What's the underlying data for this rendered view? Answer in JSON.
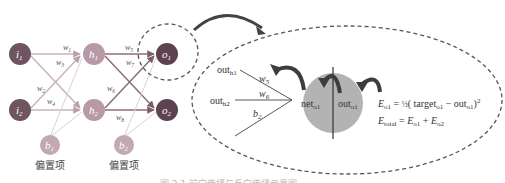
{
  "network": {
    "input_nodes": [
      {
        "id": "i1",
        "label": "i",
        "sub": "1"
      },
      {
        "id": "i2",
        "label": "i",
        "sub": "2"
      }
    ],
    "hidden_nodes": [
      {
        "id": "h1",
        "label": "h",
        "sub": "1"
      },
      {
        "id": "h2",
        "label": "h",
        "sub": "2"
      }
    ],
    "output_nodes": [
      {
        "id": "o1",
        "label": "o",
        "sub": "1"
      },
      {
        "id": "o2",
        "label": "o",
        "sub": "2"
      }
    ],
    "bias_nodes": [
      {
        "id": "b1",
        "label": "b",
        "sub": "1",
        "caption": "偏置项"
      },
      {
        "id": "b2",
        "label": "b",
        "sub": "2",
        "caption": "偏置项"
      }
    ],
    "weights": [
      {
        "label": "w",
        "sub": "1"
      },
      {
        "label": "w",
        "sub": "3"
      },
      {
        "label": "w",
        "sub": "2"
      },
      {
        "label": "w",
        "sub": "4"
      },
      {
        "label": "w",
        "sub": "5"
      },
      {
        "label": "w",
        "sub": "7"
      },
      {
        "label": "w",
        "sub": "6"
      },
      {
        "label": "w",
        "sub": "8"
      }
    ],
    "colors": {
      "input": "#6e5560",
      "hidden": "#b79aa6",
      "output": "#5e4250",
      "bias": "#c2a8b3",
      "edge": "#c9b4bc",
      "bias_edge": "#ddd0d5"
    }
  },
  "zoom": {
    "inputs": [
      {
        "label": "out",
        "sub": "h1"
      },
      {
        "label": "out",
        "sub": "h2"
      }
    ],
    "weights": [
      {
        "label": "w",
        "sub": "5"
      },
      {
        "label": "w",
        "sub": "6"
      },
      {
        "label": "b",
        "sub": "2"
      }
    ],
    "neuron": {
      "left": {
        "label": "net",
        "sub": "o1"
      },
      "right": {
        "label": "out",
        "sub": "o1"
      },
      "fill": "#b3b3b3"
    },
    "formula1": {
      "lhs": "E",
      "lhs_sub": "o1",
      "eq": " = ",
      "half": "½",
      "open": "( target",
      "t_sub": "o1",
      "minus": " −  out",
      "o_sub": "o1",
      "close": ")",
      "pow": "2"
    },
    "formula2": {
      "lhs": "E",
      "lhs_sub": "total",
      "eq": " = ",
      "t1": "E",
      "t1_sub": "o1",
      "plus": " + ",
      "t2": "E",
      "t2_sub": "o2"
    }
  },
  "caption": "图 2.1  前向传播与反向传播示意图"
}
